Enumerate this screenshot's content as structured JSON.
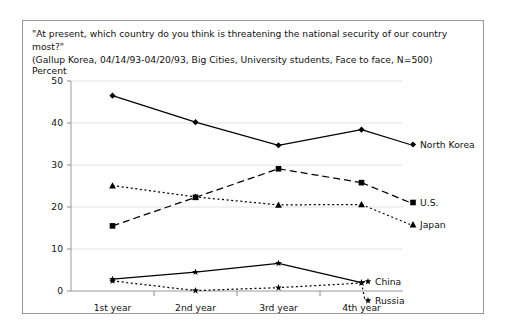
{
  "figure": {
    "question": "\"At present, which country do you think is threatening the national security of our country most?\"",
    "source": "(Gallup Korea, 04/14/93-04/20/93, Big Cities, University students, Face to face, N=500)",
    "unit_label": "Percent"
  },
  "chart_data": {
    "type": "line",
    "title": "\"At present, which country do you think is threatening the national security of our country most?\"",
    "subtitle": "(Gallup Korea, 04/14/93-04/20/93, Big Cities, University students, Face to face, N=500)",
    "xlabel": "",
    "ylabel": "Percent",
    "ylim": [
      0,
      50
    ],
    "yticks": [
      0,
      10,
      20,
      30,
      40,
      50
    ],
    "ytick_labels": [
      "0",
      "10",
      "20",
      "30",
      "40",
      "50"
    ],
    "grid": true,
    "legend_position": "right-inline",
    "categories": [
      "1st year",
      "2nd year",
      "3rd year",
      "4th year"
    ],
    "series": [
      {
        "name": "North Korea",
        "values": [
          46.5,
          40.2,
          34.7,
          38.4
        ],
        "marker": "diamond",
        "line_style": "solid",
        "color": "#000000",
        "label_x": 397,
        "label_y": 127
      },
      {
        "name": "U.S.",
        "values": [
          15.5,
          22.3,
          29.1,
          25.8
        ],
        "marker": "square",
        "line_style": "dashed",
        "color": "#000000",
        "label_x": 397,
        "label_y": 185
      },
      {
        "name": "Japan",
        "values": [
          25.1,
          22.4,
          20.5,
          20.6
        ],
        "marker": "triangle",
        "line_style": "dotted",
        "color": "#000000",
        "label_x": 397,
        "label_y": 207
      },
      {
        "name": "China",
        "values": [
          2.8,
          4.5,
          6.6,
          2.0
        ],
        "marker": "star",
        "line_style": "solid",
        "color": "#000000",
        "label_x": 352,
        "label_y": 264
      },
      {
        "name": "Russia",
        "values": [
          2.4,
          0.1,
          0.8,
          1.9
        ],
        "marker": "star",
        "line_style": "dotted",
        "color": "#000000",
        "label_x": 352,
        "label_y": 283
      }
    ]
  }
}
